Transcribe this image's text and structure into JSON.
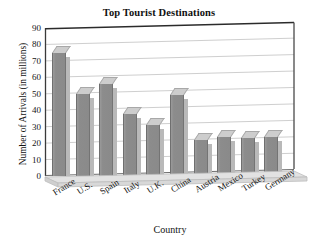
{
  "chart_data": {
    "type": "bar",
    "title": "Top Tourist Destinations",
    "xlabel": "Country",
    "ylabel": "Number of Arrivals (in millions)",
    "categories": [
      "France",
      "U.S.",
      "Spain",
      "Italy",
      "U.K.",
      "China",
      "Austria",
      "Mexico",
      "Turkey",
      "Germany"
    ],
    "values": [
      75,
      50,
      56,
      38,
      31,
      49,
      22,
      24,
      23,
      24
    ],
    "ylim": [
      0,
      90
    ],
    "yticks": [
      0,
      10,
      20,
      30,
      40,
      50,
      60,
      70,
      80,
      90
    ],
    "ytick_labels": [
      "0",
      "10",
      "20",
      "30",
      "40",
      "50",
      "60",
      "70",
      "80",
      "90"
    ],
    "grid": true,
    "legend": false,
    "style": "3d-bar",
    "colors": {
      "bar_face": "#8c8c8c",
      "bar_top": "#cdcdcd",
      "bar_side": "#b9b9b9",
      "grid": "#cfcfcf",
      "frame": "#2b2b2b",
      "floor": "#d6d6d6",
      "background": "#ffffff",
      "text": "#121212"
    }
  }
}
